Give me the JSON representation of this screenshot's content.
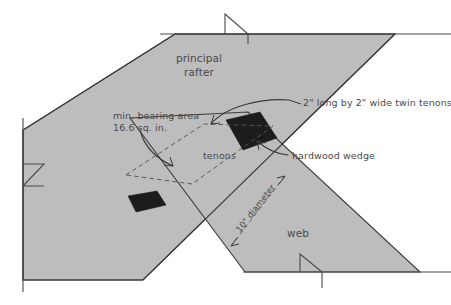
{
  "diagram": {
    "background_color": "#ffffff",
    "timber_fill_color": "#bdbdbd",
    "timber_outline_color": "#3a3a3a",
    "wedge_color": "#1c1c1c",
    "dashed_color": "#555555",
    "text_color": "#4a4a4a",
    "labels": {
      "principal_rafter_line1": "principal",
      "principal_rafter_line2": "rafter",
      "web": "web",
      "tenons": "tenons",
      "bearing_area_line1": "min. bearing area",
      "bearing_area_line2": "16.6 sq. in.",
      "twin_tenons": "2\" long by 2\" wide twin tenons",
      "hardwood_wedge": "hardwood wedge",
      "diameter": "10\" diameter"
    },
    "annotations": {
      "bearing_area_value": "16.6 sq. in.",
      "tenon_length": "2\"",
      "tenon_width": "2\"",
      "peg_diameter": "10\""
    }
  }
}
